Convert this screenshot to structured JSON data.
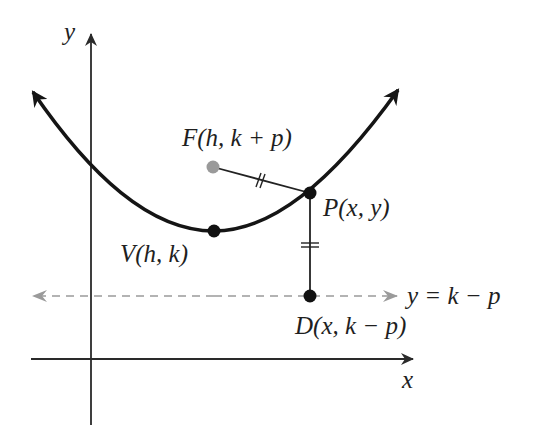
{
  "diagram": {
    "axes": {
      "x_label": "x",
      "y_label": "y"
    },
    "points": {
      "focus": {
        "name": "F",
        "coords": "(h, k + p)",
        "label": "F(h, k + p)",
        "color": "#9a9a9a"
      },
      "point": {
        "name": "P",
        "coords": "(x, y)",
        "label": "P(x, y)",
        "color": "#111111"
      },
      "vertex": {
        "name": "V",
        "coords": "(h, k)",
        "label": "V(h, k)",
        "color": "#111111"
      },
      "directrix_point": {
        "name": "D",
        "coords": "(x, k − p)",
        "label": "D(x, k − p)",
        "color": "#111111"
      }
    },
    "directrix": {
      "equation": "y = k − p",
      "style": "dashed",
      "color": "#9a9a9a"
    },
    "annotations": {
      "equal_marks": "Segments FP and PD are marked equal (double tick marks)"
    },
    "colors": {
      "curve": "#151515",
      "axes": "#2a2a2a",
      "segments": "#222222",
      "dashed": "#9a9a9a"
    }
  }
}
